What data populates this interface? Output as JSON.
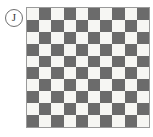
{
  "figure": {
    "label": {
      "text": "J",
      "shape": "circle"
    },
    "grid": {
      "rows": 10,
      "columns": 10,
      "pattern": "checkerboard",
      "top_left_cell": "light",
      "colors": {
        "light": "#f6f6f3",
        "dark": "#6b6b6b",
        "border": "#9a9a9a",
        "background": "#ffffff"
      }
    }
  },
  "chart_data": {
    "type": "heatmap",
    "title": "",
    "xlabel": "",
    "ylabel": "",
    "rows": 10,
    "columns": 10,
    "legend": [
      "light",
      "dark"
    ],
    "grid": true,
    "values": [
      [
        0,
        1,
        0,
        1,
        0,
        1,
        0,
        1,
        0,
        1
      ],
      [
        1,
        0,
        1,
        0,
        1,
        0,
        1,
        0,
        1,
        0
      ],
      [
        0,
        1,
        0,
        1,
        0,
        1,
        0,
        1,
        0,
        1
      ],
      [
        1,
        0,
        1,
        0,
        1,
        0,
        1,
        0,
        1,
        0
      ],
      [
        0,
        1,
        0,
        1,
        0,
        1,
        0,
        1,
        0,
        1
      ],
      [
        1,
        0,
        1,
        0,
        1,
        0,
        1,
        0,
        1,
        0
      ],
      [
        0,
        1,
        0,
        1,
        0,
        1,
        0,
        1,
        0,
        1
      ],
      [
        1,
        0,
        1,
        0,
        1,
        0,
        1,
        0,
        1,
        0
      ],
      [
        0,
        1,
        0,
        1,
        0,
        1,
        0,
        1,
        0,
        1
      ],
      [
        1,
        0,
        1,
        0,
        1,
        0,
        1,
        0,
        1,
        0
      ]
    ]
  }
}
